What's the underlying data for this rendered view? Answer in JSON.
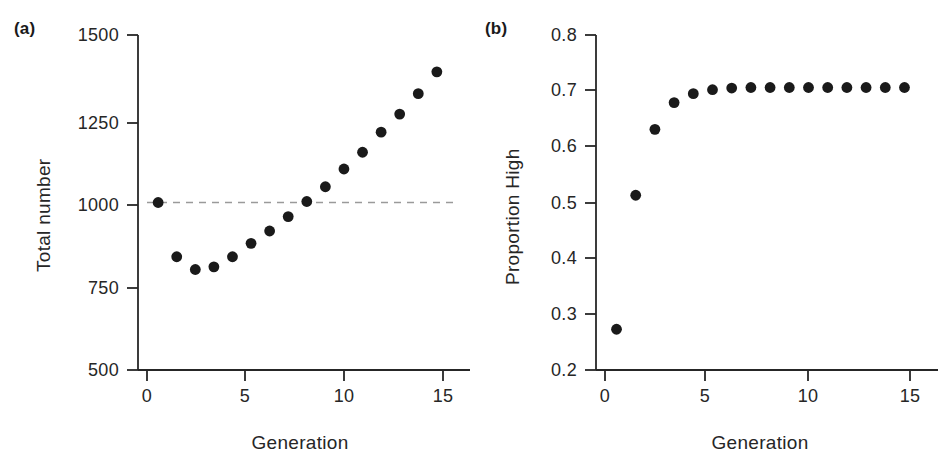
{
  "figure": {
    "background_color": "#ffffff",
    "marker_color": "#1a1a1a",
    "axis_color": "#262626",
    "reference_line_color": "#9a9a9a"
  },
  "panels": [
    {
      "id": "a",
      "label": "(a)",
      "xlabel": "Generation",
      "ylabel": "Total number",
      "xticks": [
        "0",
        "5",
        "10",
        "15"
      ],
      "yticks": [
        "500",
        "750",
        "1000",
        "1250",
        "1500"
      ],
      "reference_line_label": "1000"
    },
    {
      "id": "b",
      "label": "(b)",
      "xlabel": "Generation",
      "ylabel": "Proportion High",
      "xticks": [
        "0",
        "5",
        "10",
        "15"
      ],
      "yticks": [
        "0.2",
        "0.3",
        "0.4",
        "0.5",
        "0.6",
        "0.7",
        "0.8"
      ]
    }
  ],
  "chart_data": [
    {
      "type": "scatter",
      "panel": "a",
      "title": "(a)",
      "xlabel": "Generation",
      "ylabel": "Total number",
      "xlim": [
        -0.6,
        15.6
      ],
      "ylim": [
        500,
        1500
      ],
      "xticks": [
        0,
        5,
        10,
        15
      ],
      "yticks": [
        500,
        750,
        1000,
        1250,
        1500
      ],
      "grid": false,
      "legend": "none",
      "reference_lines": [
        {
          "orientation": "horizontal",
          "y": 1000,
          "style": "dashed",
          "color": "#9a9a9a"
        }
      ],
      "x": [
        0,
        1,
        2,
        3,
        4,
        5,
        6,
        7,
        8,
        9,
        10,
        11,
        12,
        13,
        14,
        15
      ],
      "values": [
        1000,
        838,
        800,
        808,
        838,
        878,
        915,
        958,
        1003,
        1047,
        1100,
        1150,
        1210,
        1264,
        1325,
        1390
      ]
    },
    {
      "type": "scatter",
      "panel": "b",
      "title": "(b)",
      "xlabel": "Generation",
      "ylabel": "Proportion High",
      "xlim": [
        -0.6,
        15.6
      ],
      "ylim": [
        0.2,
        0.8
      ],
      "xticks": [
        0,
        5,
        10,
        15
      ],
      "yticks": [
        0.2,
        0.3,
        0.4,
        0.5,
        0.6,
        0.7,
        0.8
      ],
      "grid": false,
      "legend": "none",
      "x": [
        0,
        1,
        2,
        3,
        4,
        5,
        6,
        7,
        8,
        9,
        10,
        11,
        12,
        13,
        14,
        15
      ],
      "values": [
        0.273,
        0.513,
        0.631,
        0.679,
        0.695,
        0.702,
        0.705,
        0.706,
        0.706,
        0.706,
        0.706,
        0.706,
        0.706,
        0.706,
        0.706,
        0.706
      ]
    }
  ]
}
